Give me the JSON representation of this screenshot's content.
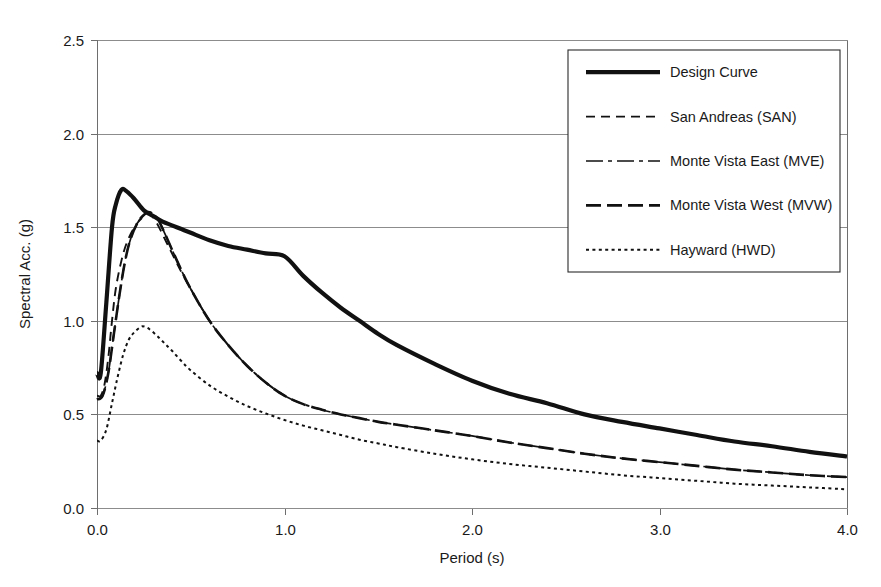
{
  "chart_data": {
    "type": "line",
    "title": "",
    "xlabel": "Period (s)",
    "ylabel": "Spectral Acc. (g)",
    "xlim": [
      0.0,
      4.0
    ],
    "ylim": [
      0.0,
      2.5
    ],
    "xticks": [
      "0.0",
      "1.0",
      "2.0",
      "3.0",
      "4.0"
    ],
    "xtick_values": [
      0.0,
      1.0,
      2.0,
      3.0,
      4.0
    ],
    "yticks": [
      "0.0",
      "0.5",
      "1.0",
      "1.5",
      "2.0",
      "2.5"
    ],
    "ytick_values": [
      0.0,
      0.5,
      1.0,
      1.5,
      2.0,
      2.5
    ],
    "grid": "horizontal",
    "legend_position": "top-right",
    "series": [
      {
        "name": "Design Curve",
        "style": "solid-thick",
        "x": [
          0.0,
          0.02,
          0.05,
          0.08,
          0.1,
          0.13,
          0.16,
          0.2,
          0.25,
          0.3,
          0.35,
          0.4,
          0.45,
          0.5,
          0.6,
          0.7,
          0.8,
          0.9,
          1.0,
          1.1,
          1.2,
          1.3,
          1.4,
          1.5,
          1.6,
          1.8,
          2.0,
          2.2,
          2.4,
          2.6,
          2.8,
          3.0,
          3.2,
          3.4,
          3.6,
          3.8,
          4.0
        ],
        "y": [
          0.72,
          0.72,
          1.1,
          1.5,
          1.62,
          1.7,
          1.69,
          1.65,
          1.59,
          1.56,
          1.53,
          1.51,
          1.49,
          1.47,
          1.43,
          1.4,
          1.38,
          1.36,
          1.345,
          1.24,
          1.15,
          1.07,
          1.0,
          0.93,
          0.87,
          0.77,
          0.68,
          0.61,
          0.56,
          0.5,
          0.46,
          0.425,
          0.39,
          0.355,
          0.33,
          0.3,
          0.275
        ]
      },
      {
        "name": "San Andreas (SAN)",
        "style": "dashed",
        "x": [
          0.0,
          0.02,
          0.04,
          0.06,
          0.08,
          0.1,
          0.13,
          0.16,
          0.2,
          0.24,
          0.28,
          0.32,
          0.36,
          0.4,
          0.45,
          0.5,
          0.6,
          0.7,
          0.8,
          0.9,
          1.0
        ],
        "y": [
          0.6,
          0.6,
          0.66,
          0.8,
          1.0,
          1.17,
          1.32,
          1.42,
          1.5,
          1.55,
          1.57,
          1.52,
          1.44,
          1.36,
          1.26,
          1.17,
          1.0,
          0.87,
          0.76,
          0.67,
          0.6
        ]
      },
      {
        "name": "Monte Vista East (MVE)",
        "style": "dash-dot-thin",
        "x": [
          0.0,
          0.03,
          0.06,
          0.09,
          0.12,
          0.15,
          0.18,
          0.22,
          0.26,
          0.28,
          0.32,
          0.36,
          0.4,
          0.45,
          0.5,
          0.6,
          0.7,
          0.8,
          0.9,
          1.0,
          1.1,
          1.2,
          1.3,
          1.4,
          1.5,
          1.6,
          1.8,
          2.0,
          2.2,
          2.4,
          2.6,
          2.8,
          3.0,
          3.2,
          3.4,
          3.6,
          3.8,
          4.0
        ],
        "y": [
          0.58,
          0.6,
          0.72,
          0.93,
          1.14,
          1.32,
          1.44,
          1.53,
          1.575,
          1.58,
          1.55,
          1.47,
          1.38,
          1.27,
          1.17,
          1.0,
          0.87,
          0.76,
          0.67,
          0.6,
          0.555,
          0.525,
          0.5,
          0.48,
          0.46,
          0.445,
          0.415,
          0.385,
          0.35,
          0.32,
          0.29,
          0.265,
          0.245,
          0.225,
          0.205,
          0.19,
          0.175,
          0.165
        ]
      },
      {
        "name": "Monte Vista West (MVW)",
        "style": "long-dash",
        "x": [
          0.0,
          0.03,
          0.06,
          0.09,
          0.12,
          0.15,
          0.18,
          0.22,
          0.26,
          0.28,
          0.32,
          0.36,
          0.4,
          0.45,
          0.5,
          0.6,
          0.7,
          0.8,
          0.9,
          1.0,
          1.1,
          1.2,
          1.3,
          1.4,
          1.5,
          1.6,
          1.8,
          2.0,
          2.2,
          2.4,
          2.6,
          2.8,
          3.0,
          3.2,
          3.4,
          3.6,
          3.8,
          4.0
        ],
        "y": [
          0.58,
          0.6,
          0.72,
          0.93,
          1.14,
          1.32,
          1.44,
          1.53,
          1.575,
          1.58,
          1.55,
          1.47,
          1.38,
          1.27,
          1.17,
          1.0,
          0.87,
          0.76,
          0.67,
          0.6,
          0.555,
          0.525,
          0.5,
          0.48,
          0.46,
          0.445,
          0.415,
          0.385,
          0.35,
          0.32,
          0.29,
          0.265,
          0.245,
          0.225,
          0.205,
          0.19,
          0.175,
          0.165
        ]
      },
      {
        "name": "Hayward (HWD)",
        "style": "dotted",
        "x": [
          0.0,
          0.02,
          0.05,
          0.08,
          0.11,
          0.14,
          0.17,
          0.2,
          0.23,
          0.25,
          0.28,
          0.32,
          0.36,
          0.4,
          0.45,
          0.5,
          0.6,
          0.7,
          0.8,
          0.9,
          1.0,
          1.1,
          1.2,
          1.3,
          1.4,
          1.5,
          1.6,
          1.8,
          2.0,
          2.2,
          2.4,
          2.6,
          2.8,
          3.0,
          3.2,
          3.4,
          3.6,
          3.8,
          4.0
        ],
        "y": [
          0.36,
          0.36,
          0.42,
          0.56,
          0.7,
          0.82,
          0.9,
          0.94,
          0.965,
          0.97,
          0.955,
          0.92,
          0.88,
          0.84,
          0.785,
          0.735,
          0.655,
          0.595,
          0.545,
          0.505,
          0.47,
          0.44,
          0.415,
          0.39,
          0.365,
          0.345,
          0.325,
          0.29,
          0.26,
          0.235,
          0.215,
          0.195,
          0.175,
          0.16,
          0.145,
          0.13,
          0.12,
          0.11,
          0.1
        ]
      }
    ],
    "legend": [
      {
        "label": "Design Curve",
        "style": "solid-thick"
      },
      {
        "label": "San Andreas (SAN)",
        "style": "dashed"
      },
      {
        "label": "Monte Vista East (MVE)",
        "style": "dash-dot-thin"
      },
      {
        "label": "Monte Vista West (MVW)",
        "style": "long-dash"
      },
      {
        "label": "Hayward (HWD)",
        "style": "dotted"
      }
    ],
    "colors": {
      "series": "#111111",
      "grid": "#8c8c8c",
      "axis": "#6e6e6e",
      "text": "#1a1a1a",
      "background": "#ffffff"
    }
  }
}
